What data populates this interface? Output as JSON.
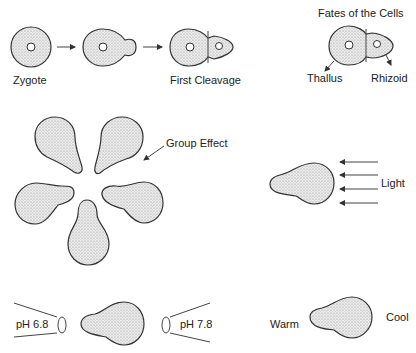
{
  "labels": {
    "zygote": "Zygote",
    "first_cleavage": "First Cleavage",
    "fates_title": "Fates of the Cells",
    "thallus": "Thallus",
    "rhizoid": "Rhizoid",
    "group_effect": "Group Effect",
    "light": "Light",
    "ph_low": "pH 6.8",
    "ph_high": "pH 7.8",
    "warm": "Warm",
    "cool": "Cool"
  },
  "colors": {
    "stroke": "#333333",
    "stipple": "#9a9a9a",
    "background": "#ffffff"
  }
}
